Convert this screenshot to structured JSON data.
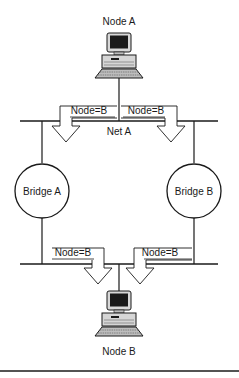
{
  "diagram": {
    "nodes": {
      "node_a": {
        "label": "Node A"
      },
      "node_b": {
        "label": "Node B"
      }
    },
    "networks": {
      "net_a": {
        "label": "Net A"
      }
    },
    "bridges": {
      "bridge_a": {
        "label": "Bridge A"
      },
      "bridge_b": {
        "label": "Bridge B"
      }
    },
    "frames": {
      "top_left": {
        "label": "Node=B"
      },
      "top_right": {
        "label": "Node=B"
      },
      "bottom_left": {
        "label": "Node=B"
      },
      "bottom_right": {
        "label": "Node=B"
      }
    },
    "colors": {
      "line": "#1a1a1a",
      "background": "#ffffff"
    }
  }
}
